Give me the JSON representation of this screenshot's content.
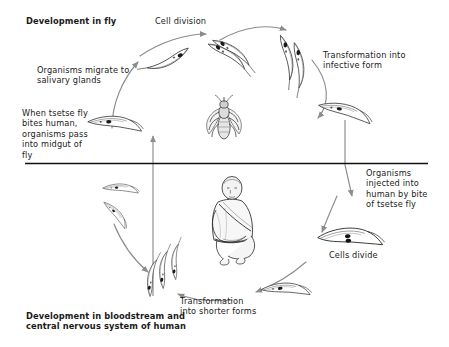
{
  "figure": {
    "background_color": "#ffffff",
    "ink_color": "#1a1a1a",
    "arrow_color": "#8c8c8c",
    "divider_color": "#111111"
  },
  "labels": {
    "development_in_fly": "Development in fly",
    "cell_division": "Cell division",
    "transformation_into_infective_form": "Transformation into\ninfective form",
    "organisms_migrate": "Organisms migrate to\nsalivary glands",
    "when_tsetse_bites": "When tsetse fly\nbites human,\norganisms pass\ninto midgut of\nfly",
    "organisms_injected": "Organisms\ninjected into\nhuman by bite\nof tsetse fly",
    "cells_divide": "Cells divide",
    "transformation_into_shorter_forms": "Transformation\ninto shorter forms",
    "development_in_bloodstream": "Development in bloodstream and\ncentral nervous system of human"
  },
  "illustrations": {
    "tsetse_fly": "tsetse-fly-illustration",
    "human": "seated-human-illustration",
    "trypanosomes_fly_phase": [
      "trypanosome-dividing-top",
      "trypanosome-pair-upper-right",
      "trypanosome-infective-right",
      "trypanosome-upper-left",
      "trypanosome-salivary-gland-left"
    ],
    "trypanosomes_human_phase": [
      "trypanosome-short-form-left-upper",
      "trypanosome-short-form-left",
      "trypanosome-slender-lower-left-a",
      "trypanosome-slender-lower-left-b",
      "trypanosome-slender-lower-left-c",
      "trypanosome-short-bottom",
      "trypanosome-dividing-right"
    ]
  },
  "divider": {
    "name": "fly-human-divider-line",
    "y": 163
  }
}
